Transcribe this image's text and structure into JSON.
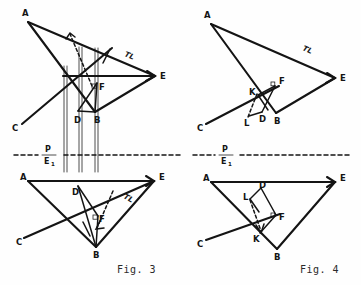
{
  "page": {
    "background_color": "#fefefe",
    "ink_color": "#141414",
    "width": 361,
    "height": 285
  },
  "captions": {
    "fig3": "Fig. 3",
    "fig4": "Fig. 4"
  },
  "fold_line": {
    "numerator": "P",
    "denominator": "E",
    "subscript": "1",
    "style": "dash-dot"
  },
  "figures": [
    {
      "id": "fig3-top",
      "name": "fig3-front-view",
      "caption_ref": "fig3",
      "vertex_labels": [
        {
          "text": "A",
          "x": 22,
          "y": 16
        },
        {
          "text": "E",
          "x": 160,
          "y": 74
        },
        {
          "text": "C",
          "x": 16,
          "y": 128
        },
        {
          "text": "B",
          "x": 97,
          "y": 118
        },
        {
          "text": "D",
          "x": 79,
          "y": 118
        },
        {
          "text": "F",
          "x": 100,
          "y": 90
        }
      ],
      "annotations": [
        {
          "text": "TL",
          "x": 124,
          "y": 56,
          "rotation": 22
        }
      ]
    },
    {
      "id": "fig4-top",
      "name": "fig4-front-view",
      "caption_ref": "fig4",
      "vertex_labels": [
        {
          "text": "A",
          "x": 204,
          "y": 18
        },
        {
          "text": "E",
          "x": 340,
          "y": 76
        },
        {
          "text": "C",
          "x": 201,
          "y": 128
        },
        {
          "text": "B",
          "x": 275,
          "y": 119
        },
        {
          "text": "D",
          "x": 262,
          "y": 117
        },
        {
          "text": "F",
          "x": 275,
          "y": 84
        },
        {
          "text": "K",
          "x": 253,
          "y": 92
        },
        {
          "text": "L",
          "x": 248,
          "y": 121
        }
      ],
      "annotations": [
        {
          "text": "TL",
          "x": 302,
          "y": 50,
          "rotation": 24
        }
      ]
    },
    {
      "id": "fig3-bottom",
      "name": "fig3-top-view",
      "caption_ref": "fig3",
      "vertex_labels": [
        {
          "text": "A",
          "x": 22,
          "y": 176
        },
        {
          "text": "E",
          "x": 158,
          "y": 176
        },
        {
          "text": "C",
          "x": 20,
          "y": 242
        },
        {
          "text": "B",
          "x": 96,
          "y": 252
        },
        {
          "text": "D",
          "x": 75,
          "y": 192
        },
        {
          "text": "F",
          "x": 99,
          "y": 221
        }
      ],
      "annotations": [
        {
          "text": "TL",
          "x": 123,
          "y": 198,
          "rotation": 28
        }
      ]
    },
    {
      "id": "fig4-bottom",
      "name": "fig4-top-view",
      "caption_ref": "fig4",
      "vertex_labels": [
        {
          "text": "A",
          "x": 204,
          "y": 178
        },
        {
          "text": "E",
          "x": 340,
          "y": 178
        },
        {
          "text": "C",
          "x": 201,
          "y": 243
        },
        {
          "text": "B",
          "x": 276,
          "y": 254
        },
        {
          "text": "D",
          "x": 261,
          "y": 192
        },
        {
          "text": "F",
          "x": 278,
          "y": 219
        },
        {
          "text": "K",
          "x": 256,
          "y": 238
        },
        {
          "text": "L",
          "x": 246,
          "y": 197
        }
      ],
      "annotations": []
    }
  ],
  "legend": {
    "tl_meaning": "TL",
    "point_names": [
      "A",
      "B",
      "C",
      "D",
      "E",
      "F",
      "K",
      "L"
    ]
  }
}
